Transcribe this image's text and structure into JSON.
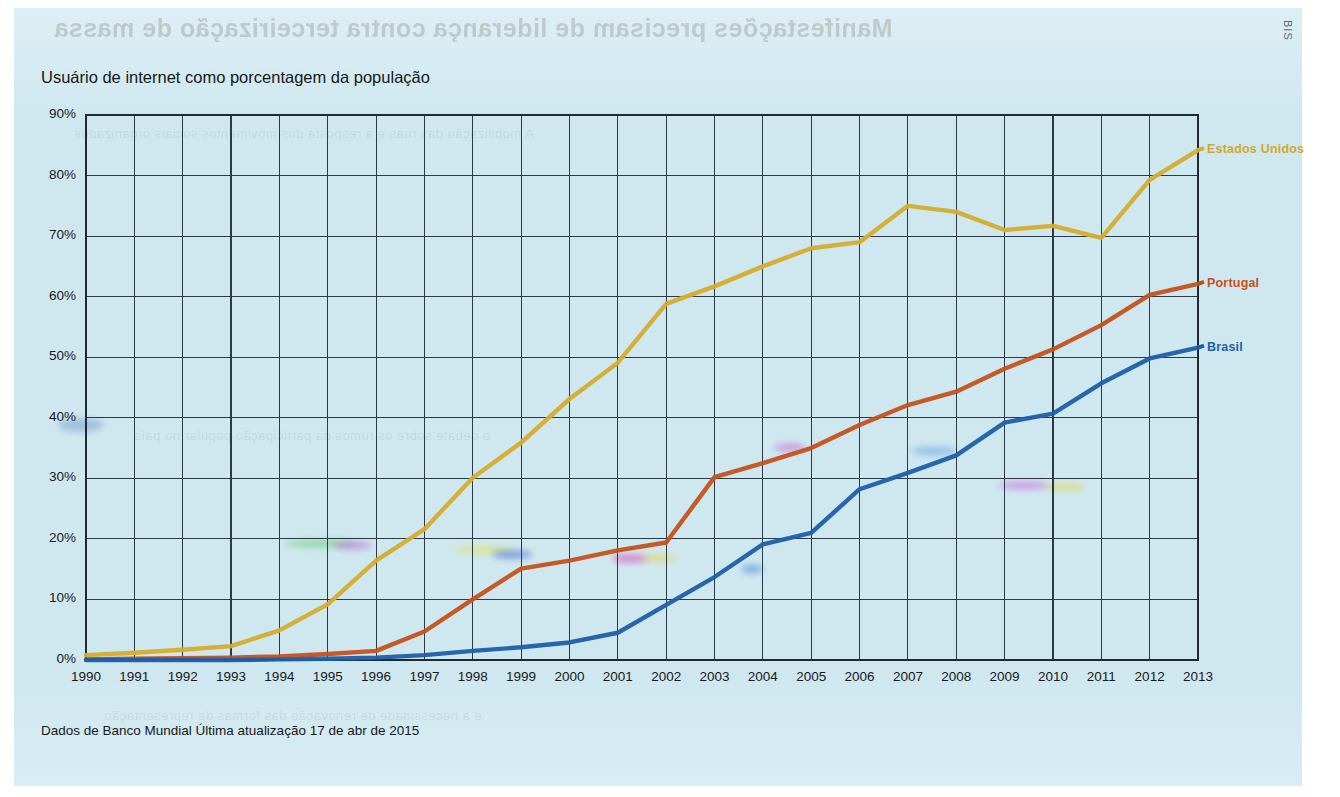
{
  "page": {
    "background_color": "#cfe8f0",
    "corner_mark": "BIS"
  },
  "chart_title": "Usuário de internet como porcentagem da população",
  "footnote": "Dados de Banco Mundial   Última atualização 17 de abr de 2015",
  "ghost_text": {
    "title": "Manifestações precisam de liderança contra terceirização de massa",
    "lines": [
      "A mobilização das ruas e a resposta dos movimentos sociais organizados",
      "o debate sobre os rumos da participação popular no país",
      "e a necessidade de renovação das formas de representação"
    ]
  },
  "chart_data": {
    "type": "line",
    "title": "Usuário de internet como porcentagem da população",
    "xlabel": "",
    "ylabel": "",
    "xlim": [
      1990,
      2013
    ],
    "ylim": [
      0,
      90
    ],
    "ytick_labels": [
      "0%",
      "10%",
      "20%",
      "30%",
      "40%",
      "50%",
      "60%",
      "70%",
      "80%",
      "90%"
    ],
    "ytick_values": [
      0,
      10,
      20,
      30,
      40,
      50,
      60,
      70,
      80,
      90
    ],
    "grid": true,
    "legend_position": "right-inline",
    "x": [
      1990,
      1991,
      1992,
      1993,
      1994,
      1995,
      1996,
      1997,
      1998,
      1999,
      2000,
      2001,
      2002,
      2003,
      2004,
      2005,
      2006,
      2007,
      2008,
      2009,
      2010,
      2011,
      2012,
      2013
    ],
    "categories": [
      "1990",
      "1991",
      "1992",
      "1993",
      "1994",
      "1995",
      "1996",
      "1997",
      "1998",
      "1999",
      "2000",
      "2001",
      "2002",
      "2003",
      "2004",
      "2005",
      "2006",
      "2007",
      "2008",
      "2009",
      "2010",
      "2011",
      "2012",
      "2013"
    ],
    "series": [
      {
        "name": "Estados Unidos",
        "color": "#d4ad2e",
        "label_color": "#d2a82b",
        "values": [
          0.8,
          1.2,
          1.7,
          2.3,
          4.9,
          9.2,
          16.4,
          21.6,
          30.1,
          35.9,
          43.1,
          49.1,
          58.8,
          61.7,
          65.0,
          68.0,
          69.0,
          75.0,
          74.0,
          71.0,
          71.7,
          69.7,
          79.3,
          84.2
        ]
      },
      {
        "name": "Portugal",
        "color": "#c4511b",
        "label_color": "#c4511b",
        "values": [
          0.1,
          0.2,
          0.3,
          0.4,
          0.6,
          1.0,
          1.5,
          4.7,
          10.0,
          15.1,
          16.4,
          18.1,
          19.4,
          30.2,
          32.5,
          35.0,
          38.8,
          42.1,
          44.3,
          48.1,
          51.3,
          55.3,
          60.3,
          62.1
        ]
      },
      {
        "name": "Brasil",
        "color": "#1f5fa8",
        "label_color": "#1f5fa8",
        "values": [
          0.0,
          0.0,
          0.0,
          0.0,
          0.1,
          0.2,
          0.4,
          0.8,
          1.5,
          2.1,
          2.9,
          4.5,
          9.1,
          13.7,
          19.1,
          21.0,
          28.2,
          30.9,
          33.8,
          39.2,
          40.7,
          45.7,
          49.8,
          51.6
        ]
      }
    ]
  }
}
